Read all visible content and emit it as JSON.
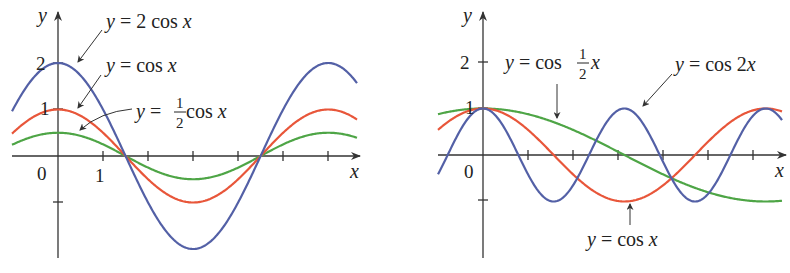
{
  "colors": {
    "blue": "#5360a6",
    "red": "#e8563a",
    "green": "#4ea546",
    "axis": "#333333"
  },
  "chart_data": [
    {
      "type": "line",
      "title": "",
      "xlabel": "x",
      "ylabel": "y",
      "x_ticks_labeled": [
        "0",
        "1"
      ],
      "y_ticks_labeled": [
        "1",
        "2"
      ],
      "xlim": [
        -1.1,
        7.0
      ],
      "ylim": [
        -2.4,
        2.4
      ],
      "grid": false,
      "legend": "annotations",
      "series": [
        {
          "name": "y = 2 cos x",
          "formula": "2*cos(x)",
          "color": "#5360a6",
          "annotation": "y = 2 cos x"
        },
        {
          "name": "y = cos x",
          "formula": "cos(x)",
          "color": "#e8563a",
          "annotation": "y = cos x"
        },
        {
          "name": "y = 1/2 cos x",
          "formula": "0.5*cos(x)",
          "color": "#4ea546",
          "annotation": "y = ½ cos x"
        }
      ]
    },
    {
      "type": "line",
      "title": "",
      "xlabel": "x",
      "ylabel": "y",
      "x_ticks_labeled": [
        "0"
      ],
      "y_ticks_labeled": [
        "1",
        "2"
      ],
      "xlim": [
        -1.0,
        6.6
      ],
      "ylim": [
        -2.1,
        2.4
      ],
      "grid": false,
      "legend": "annotations",
      "series": [
        {
          "name": "y = cos 1/2 x",
          "formula": "cos(0.5*x)",
          "color": "#4ea546",
          "annotation": "y = cos ½ x"
        },
        {
          "name": "y = cos 2x",
          "formula": "cos(2*x)",
          "color": "#5360a6",
          "annotation": "y = cos 2x"
        },
        {
          "name": "y = cos x",
          "formula": "cos(x)",
          "color": "#e8563a",
          "annotation": "y = cos x"
        }
      ]
    }
  ],
  "left": {
    "axis_y_label": "y",
    "axis_x_label": "x",
    "tick_0": "0",
    "tick_1": "1",
    "tick_y1": "1",
    "tick_y2": "2",
    "label_2cos": {
      "y": "y",
      "rest": " = 2 cos ",
      "x": "x"
    },
    "label_cos": {
      "y": "y",
      "rest": " = cos ",
      "x": "x"
    },
    "label_halfcos": {
      "y": "y",
      "eq": " = ",
      "num": "1",
      "den": "2",
      "rest": " cos ",
      "x": "x"
    }
  },
  "right": {
    "axis_y_label": "y",
    "axis_x_label": "x",
    "tick_0": "0",
    "tick_y1": "1",
    "tick_y2": "2",
    "label_cos_half": {
      "y": "y",
      "rest": " = cos ",
      "num": "1",
      "den": "2",
      "x": "x"
    },
    "label_cos2x": {
      "y": "y",
      "rest": " = cos 2",
      "x": "x"
    },
    "label_cos": {
      "y": "y",
      "rest": " = cos ",
      "x": "x"
    }
  }
}
